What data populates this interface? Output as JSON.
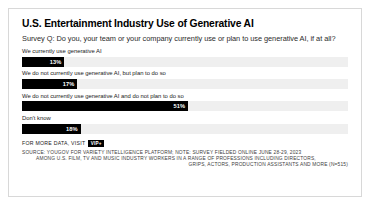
{
  "chart_data": {
    "type": "bar",
    "title": "U.S. Entertainment Industry Use of Generative AI",
    "subtitle": "Survey Q: Do you, your team or your company currently use or plan to use generative AI, if at all?",
    "orientation": "horizontal",
    "xlabel": "",
    "ylabel": "",
    "xlim": [
      0,
      100
    ],
    "grid": false,
    "legend": "none",
    "value_suffix": "%",
    "bar_color": "#000000",
    "track_color": "#efefef",
    "categories": [
      "We currently use generative AI",
      "We do not currently use generative AI, but plan to do so",
      "We do not currently use generative AI and do not plan to do so",
      "Don't know"
    ],
    "values": [
      13,
      17,
      51,
      18
    ],
    "value_labels": [
      "13%",
      "17%",
      "51%",
      "18%"
    ]
  },
  "footer": {
    "more_data_text": "FOR MORE DATA, VISIT",
    "badge_label": "VIP+",
    "source_lines": [
      "SOURCE: YOUGOV FOR VARIETY INTELLIGENCE PLATFORM; NOTE: SURVEY FIELDED ONLINE JUNE 28-29, 2023",
      "AMONG U.S. FILM, TV AND MUSIC INDUSTRY WORKERS IN A RANGE OF PROFESSIONS INCLUDING DIRECTORS,",
      "GRIPS, ACTORS, PRODUCTION ASSISTANTS AND MORE (N=515)"
    ]
  }
}
